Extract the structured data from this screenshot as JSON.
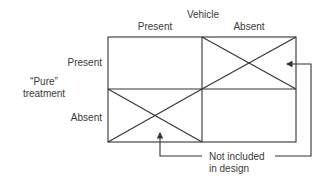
{
  "diagram": {
    "column_factor": "Vehicle",
    "row_factor": "“Pure” treatment",
    "row_factor_lines": [
      "“Pure”",
      "treatment"
    ],
    "columns": [
      "Present",
      "Absent"
    ],
    "rows": [
      "Present",
      "Absent"
    ],
    "cells": [
      {
        "row": "Present",
        "column": "Present",
        "included": true
      },
      {
        "row": "Present",
        "column": "Absent",
        "included": false
      },
      {
        "row": "Absent",
        "column": "Present",
        "included": false
      },
      {
        "row": "Absent",
        "column": "Absent",
        "included": true
      }
    ],
    "annotation_lines": [
      "Not included",
      "in design"
    ],
    "annotation": "Not included in design",
    "line_color": "#333333"
  }
}
